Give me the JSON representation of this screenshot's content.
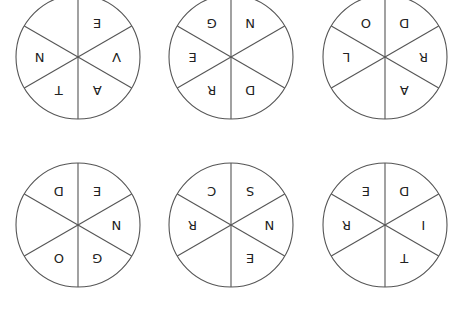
{
  "puzzle": {
    "wheels": [
      {
        "id": "wheel-1",
        "cx": 78,
        "cy": 57,
        "r": 62,
        "letters": [
          "E",
          "V",
          "A",
          "T",
          "N",
          ""
        ]
      },
      {
        "id": "wheel-2",
        "cx": 231,
        "cy": 57,
        "r": 62,
        "letters": [
          "N",
          "",
          "D",
          "R",
          "E",
          "G"
        ]
      },
      {
        "id": "wheel-3",
        "cx": 385,
        "cy": 57,
        "r": 62,
        "letters": [
          "D",
          "R",
          "A",
          "",
          "L",
          "O"
        ]
      },
      {
        "id": "wheel-4",
        "cx": 78,
        "cy": 225,
        "r": 62,
        "letters": [
          "E",
          "N",
          "G",
          "O",
          "",
          "D"
        ]
      },
      {
        "id": "wheel-5",
        "cx": 231,
        "cy": 225,
        "r": 62,
        "letters": [
          "S",
          "N",
          "E",
          "",
          "R",
          "C"
        ]
      },
      {
        "id": "wheel-6",
        "cx": 385,
        "cy": 225,
        "r": 62,
        "letters": [
          "D",
          "I",
          "T",
          "",
          "R",
          "E"
        ]
      }
    ],
    "letter_orientation": "upside-down",
    "line_color": "#555555",
    "letter_color": "#222222"
  }
}
